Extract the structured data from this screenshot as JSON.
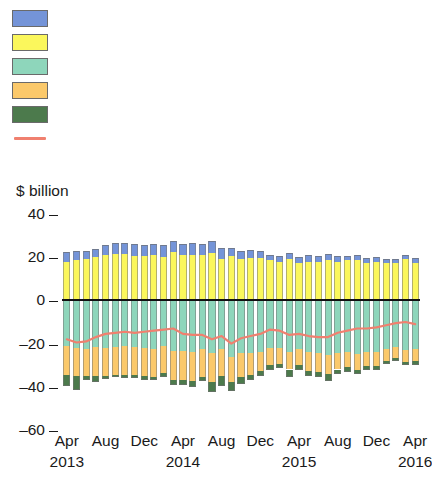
{
  "chart_data": {
    "type": "bar",
    "title": "",
    "subtitle": "",
    "xlabel": "",
    "ylabel": "$ billion",
    "ylim": [
      -60,
      40
    ],
    "yticks": [
      40,
      20,
      0,
      -20,
      -40,
      -60
    ],
    "grid": false,
    "stacked": true,
    "legend_position": "top-left",
    "legend": [
      {
        "label": "Oil exports",
        "color": "#7494d8",
        "type": "bar"
      },
      {
        "label": "Other exports",
        "color": "#fbf75c",
        "type": "bar"
      },
      {
        "label": "Other imports",
        "color": "#8ed6bb",
        "type": "bar"
      },
      {
        "label": "Oil imports",
        "color": "#fbc96b",
        "type": "bar"
      },
      {
        "label": "Gold imports",
        "color": "#4c7a4c",
        "type": "bar"
      },
      {
        "label": "Trade balance",
        "color": "#f0806f",
        "type": "line"
      }
    ],
    "x": [
      "Apr 2013",
      "May 2013",
      "Jun 2013",
      "Jul 2013",
      "Aug 2013",
      "Sep 2013",
      "Oct 2013",
      "Nov 2013",
      "Dec 2013",
      "Jan 2014",
      "Feb 2014",
      "Mar 2014",
      "Apr 2014",
      "May 2014",
      "Jun 2014",
      "Jul 2014",
      "Aug 2014",
      "Sep 2014",
      "Oct 2014",
      "Nov 2014",
      "Dec 2014",
      "Jan 2015",
      "Feb 2015",
      "Mar 2015",
      "Apr 2015",
      "May 2015",
      "Jun 2015",
      "Jul 2015",
      "Aug 2015",
      "Sep 2015",
      "Oct 2015",
      "Nov 2015",
      "Dec 2015",
      "Jan 2016",
      "Feb 2016",
      "Mar 2016",
      "Apr 2016"
    ],
    "xtick_labels": [
      {
        "month": "Apr",
        "year": "2013",
        "index": 0
      },
      {
        "month": "Aug",
        "year": "",
        "index": 4
      },
      {
        "month": "Dec",
        "year": "",
        "index": 8
      },
      {
        "month": "Apr",
        "year": "2014",
        "index": 12
      },
      {
        "month": "Aug",
        "year": "",
        "index": 16
      },
      {
        "month": "Dec",
        "year": "",
        "index": 20
      },
      {
        "month": "Apr",
        "year": "2015",
        "index": 24
      },
      {
        "month": "Aug",
        "year": "",
        "index": 28
      },
      {
        "month": "Dec",
        "year": "",
        "index": 32
      },
      {
        "month": "Apr",
        "year": "2016",
        "index": 36
      }
    ],
    "series": [
      {
        "name": "Other exports",
        "color": "#fbf75c",
        "stack": "positive",
        "values": [
          18.0,
          18.5,
          19.0,
          20.0,
          21.0,
          21.5,
          21.5,
          20.5,
          20.5,
          21.0,
          20.0,
          22.5,
          21.0,
          21.0,
          21.0,
          22.0,
          19.0,
          20.5,
          19.0,
          19.5,
          19.5,
          18.5,
          18.0,
          19.0,
          17.5,
          18.0,
          18.0,
          18.5,
          18.0,
          18.5,
          18.5,
          17.5,
          18.0,
          17.5,
          17.5,
          19.0,
          17.5
        ]
      },
      {
        "name": "Oil exports",
        "color": "#7494d8",
        "stack": "positive",
        "values": [
          4.5,
          4.5,
          4.0,
          4.0,
          4.5,
          5.0,
          5.0,
          5.5,
          5.0,
          5.0,
          5.5,
          5.0,
          5.0,
          5.5,
          5.0,
          5.5,
          5.5,
          4.0,
          4.0,
          4.0,
          3.5,
          2.5,
          2.5,
          3.0,
          2.5,
          3.0,
          2.5,
          3.0,
          2.5,
          2.0,
          2.5,
          2.0,
          2.0,
          1.5,
          1.5,
          2.0,
          2.0
        ]
      },
      {
        "name": "Other imports",
        "color": "#8ed6bb",
        "stack": "negative",
        "values": [
          -21.0,
          -22.0,
          -22.5,
          -21.5,
          -22.0,
          -21.5,
          -21.0,
          -21.5,
          -22.0,
          -22.5,
          -21.0,
          -23.5,
          -23.5,
          -24.0,
          -22.5,
          -24.5,
          -22.5,
          -26.0,
          -24.5,
          -24.5,
          -24.0,
          -22.0,
          -22.0,
          -24.0,
          -22.5,
          -24.0,
          -24.5,
          -25.5,
          -24.5,
          -24.0,
          -25.0,
          -24.0,
          -24.0,
          -22.5,
          -21.5,
          -23.0,
          -22.5
        ]
      },
      {
        "name": "Oil imports",
        "color": "#fbc96b",
        "stack": "negative",
        "values": [
          -13.5,
          -13.0,
          -12.5,
          -13.5,
          -13.0,
          -13.0,
          -13.5,
          -13.0,
          -13.0,
          -13.0,
          -12.5,
          -13.5,
          -13.5,
          -13.5,
          -13.0,
          -13.5,
          -12.5,
          -12.0,
          -11.0,
          -10.0,
          -8.5,
          -8.0,
          -7.5,
          -8.0,
          -7.5,
          -8.5,
          -8.5,
          -8.5,
          -7.5,
          -7.0,
          -7.0,
          -6.5,
          -6.5,
          -5.5,
          -5.0,
          -5.5,
          -5.5
        ]
      },
      {
        "name": "Gold imports",
        "color": "#4c7a4c",
        "stack": "negative",
        "values": [
          -5.0,
          -6.5,
          -2.0,
          -3.0,
          -1.5,
          -1.0,
          -1.5,
          -1.5,
          -2.0,
          -1.5,
          -2.0,
          -2.0,
          -2.0,
          -2.5,
          -2.0,
          -4.5,
          -4.5,
          -4.0,
          -3.0,
          -2.5,
          -2.5,
          -2.0,
          -2.0,
          -3.5,
          -2.0,
          -2.5,
          -2.5,
          -3.5,
          -2.0,
          -2.0,
          -2.0,
          -1.5,
          -1.5,
          -1.5,
          -1.5,
          -1.5,
          -2.0
        ]
      }
    ],
    "line_series": {
      "name": "Trade balance",
      "color": "#f0806f",
      "values": [
        -18.0,
        -19.5,
        -19.0,
        -17.0,
        -15.5,
        -15.0,
        -14.5,
        -15.0,
        -14.5,
        -14.0,
        -13.5,
        -13.0,
        -15.5,
        -16.0,
        -16.0,
        -18.0,
        -16.5,
        -20.0,
        -17.5,
        -16.5,
        -15.5,
        -13.5,
        -14.0,
        -16.0,
        -15.5,
        -16.5,
        -17.0,
        -17.0,
        -15.0,
        -14.0,
        -13.0,
        -13.0,
        -12.5,
        -11.5,
        -10.5,
        -10.0,
        -11.0
      ]
    }
  }
}
